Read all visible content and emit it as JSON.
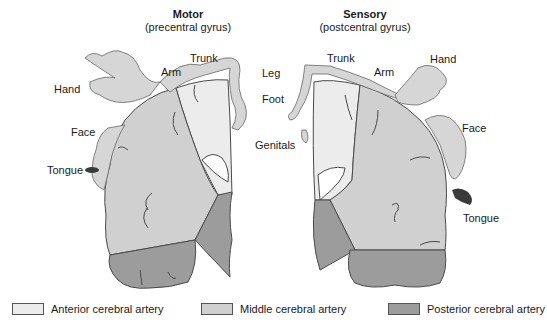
{
  "colors": {
    "anterior": "#ececec",
    "middle": "#d0d0d0",
    "posterior": "#9c9c9c",
    "outline": "#4a4a4a",
    "tongue": "#3a3a3a"
  },
  "motor": {
    "title": "Motor",
    "subtitle": "(precentral gyrus)",
    "labels": {
      "trunk": "Trunk",
      "arm": "Arm",
      "hand": "Hand",
      "face": "Face",
      "tongue": "Tongue"
    }
  },
  "sensory": {
    "title": "Sensory",
    "subtitle": "(postcentral gyrus)",
    "labels": {
      "leg": "Leg",
      "foot": "Foot",
      "genitals": "Genitals",
      "trunk": "Trunk",
      "arm": "Arm",
      "hand": "Hand",
      "face": "Face",
      "tongue": "Tongue"
    }
  },
  "legend": [
    {
      "label": "Anterior cerebral artery",
      "color": "#ececec"
    },
    {
      "label": "Middle cerebral artery",
      "color": "#d0d0d0"
    },
    {
      "label": "Posterior cerebral artery",
      "color": "#9c9c9c"
    }
  ]
}
